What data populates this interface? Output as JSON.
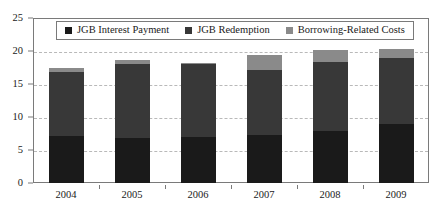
{
  "chart_data": {
    "type": "bar",
    "subtype": "stacked",
    "title": "",
    "subtitle": "",
    "xlabel": "",
    "ylabel": "",
    "categories": [
      "2004",
      "2005",
      "2006",
      "2007",
      "2008",
      "2009"
    ],
    "series": [
      {
        "name": "JGB Interest Payment",
        "color": "#1a1a1a",
        "values": [
          7.1,
          6.8,
          7.0,
          7.2,
          7.9,
          9.0
        ]
      },
      {
        "name": "JGB Redemption",
        "color": "#383838",
        "values": [
          9.7,
          11.2,
          11.0,
          9.9,
          10.4,
          9.9
        ]
      },
      {
        "name": "Borrowing-Related Costs",
        "color": "#8a8a8a",
        "values": [
          0.7,
          0.7,
          0.2,
          2.3,
          1.8,
          1.4
        ]
      }
    ],
    "totals": [
      17.5,
      18.7,
      18.2,
      19.4,
      20.1,
      20.3
    ],
    "ylim": [
      0,
      25
    ],
    "y_ticks": [
      0,
      5,
      10,
      15,
      20,
      25
    ],
    "y_tick_labels": [
      "0",
      "5",
      "10",
      "15",
      "20",
      "25"
    ],
    "grid": true,
    "grid_axis": "y",
    "legend_position": "top-inside",
    "legend": [
      "JGB Interest Payment",
      "JGB Redemption",
      "Borrowing-Related Costs"
    ]
  },
  "colors": {
    "interest": "#1a1a1a",
    "redemption": "#383838",
    "borrowing": "#8a8a8a",
    "grid": "#b9b9b9",
    "axis": "#7a7a7a",
    "background": "#ffffff"
  }
}
